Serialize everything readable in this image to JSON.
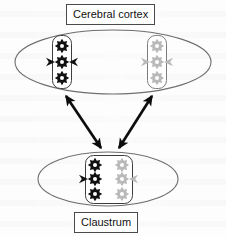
{
  "diagram": {
    "title_top": "Cerebral cortex",
    "title_bottom": "Claustrum",
    "regions": [
      {
        "id": "cerebral-cortex",
        "label": "Cerebral cortex",
        "shape": "ellipse",
        "center_x": 113,
        "center_y": 62,
        "radius_x": 98,
        "radius_y": 32,
        "clusters": [
          {
            "id": "cortex-cluster-left",
            "color": "#111111",
            "color_name": "black",
            "cells": 3,
            "x": 62,
            "y": 62
          },
          {
            "id": "cortex-cluster-right",
            "color": "#b9b9b9",
            "color_name": "grey",
            "cells": 3,
            "x": 157,
            "y": 62
          }
        ]
      },
      {
        "id": "claustrum",
        "label": "Claustrum",
        "shape": "ellipse",
        "center_x": 108,
        "center_y": 179,
        "radius_x": 70,
        "radius_y": 27,
        "clusters": [
          {
            "id": "claustrum-cluster-left",
            "color": "#111111",
            "color_name": "black",
            "cells": 3,
            "x": 95,
            "y": 179
          },
          {
            "id": "claustrum-cluster-right",
            "color": "#b9b9b9",
            "color_name": "grey",
            "cells": 3,
            "x": 122,
            "y": 179
          }
        ]
      }
    ],
    "connections": [
      {
        "id": "connection-left",
        "from": "claustrum-cluster-left",
        "to": "cortex-cluster-left",
        "arrowheads": "both",
        "x1": 101,
        "y1": 148,
        "x2": 66,
        "y2": 96
      },
      {
        "id": "connection-right",
        "from": "claustrum-cluster-right",
        "to": "cortex-cluster-right",
        "arrowheads": "both",
        "x1": 119,
        "y1": 148,
        "x2": 152,
        "y2": 96
      }
    ],
    "colors": {
      "outline": "#6e6e6e",
      "arrow": "#0d0d0d",
      "cell_dark": "#111111",
      "cell_light": "#b9b9b9",
      "label_border": "#4a4a4a",
      "background": "#fdfdfd"
    }
  }
}
